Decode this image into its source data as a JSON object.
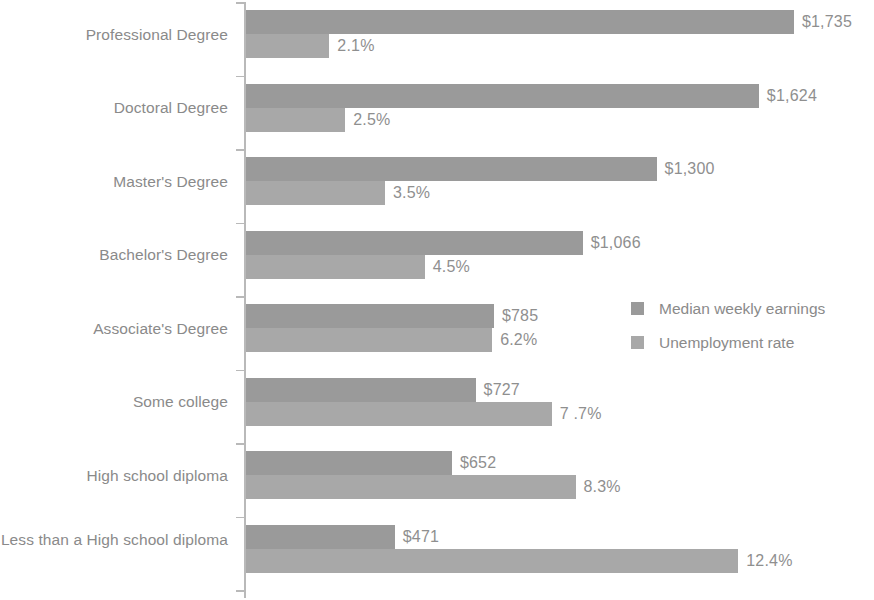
{
  "chart_data": {
    "type": "bar",
    "orientation": "horizontal",
    "title": "",
    "subtitle": "",
    "xlabel": "",
    "ylabel": "",
    "grid": false,
    "legend_position": "middle-right",
    "categories": [
      "Professional Degree",
      "Doctoral Degree",
      "Master's Degree",
      "Bachelor's Degree",
      "Associate's Degree",
      "Some college",
      "High school diploma",
      "Less than a High school diploma"
    ],
    "series": [
      {
        "name": "Median weekly earnings",
        "unit": "USD",
        "color": "#9a9a9a",
        "values": [
          1735,
          1624,
          1300,
          1066,
          785,
          727,
          652,
          471
        ],
        "data_labels": [
          "$1,735",
          "$1,624",
          "$1,300",
          "$1,066",
          "$785",
          "$727",
          "$652",
          "$471"
        ]
      },
      {
        "name": "Unemployment rate",
        "unit": "percent",
        "color": "#a8a8a8",
        "values": [
          2.1,
          2.5,
          3.5,
          4.5,
          6.2,
          7.7,
          8.3,
          12.4
        ],
        "data_labels": [
          "2.1%",
          "2.5%",
          "3.5%",
          "4.5%",
          "6.2%",
          "7 .7%",
          "8.3%",
          "12.4%"
        ]
      }
    ]
  },
  "legend": {
    "items": [
      {
        "label": "Median weekly earnings",
        "color": "#9a9a9a"
      },
      {
        "label": "Unemployment rate",
        "color": "#a8a8a8"
      }
    ]
  },
  "axis": {
    "tick_count": 9
  }
}
